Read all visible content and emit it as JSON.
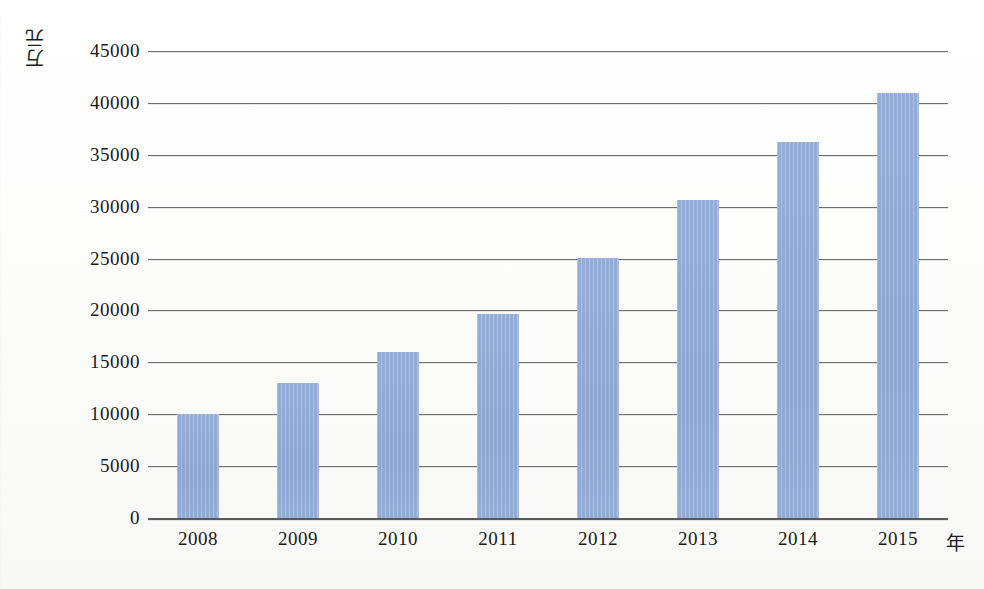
{
  "chart_data": {
    "type": "bar",
    "title": "",
    "subtitle": "",
    "xlabel": "年",
    "ylabel": "万元",
    "categories": [
      "2008",
      "2009",
      "2010",
      "2011",
      "2012",
      "2013",
      "2014",
      "2015"
    ],
    "values": [
      10000,
      13000,
      16000,
      19700,
      25100,
      30600,
      36200,
      41000
    ],
    "series": [
      {
        "name": "",
        "values": [
          10000,
          13000,
          16000,
          19700,
          25100,
          30600,
          36200,
          41000
        ]
      }
    ],
    "ylim": [
      0,
      45000
    ],
    "ytick_labels": [
      "0",
      "5000",
      "10000",
      "15000",
      "20000",
      "25000",
      "30000",
      "35000",
      "40000",
      "45000"
    ],
    "ytick_values": [
      0,
      5000,
      10000,
      15000,
      20000,
      25000,
      30000,
      35000,
      40000,
      45000
    ],
    "ytick_step": 5000,
    "grid": true,
    "grid_axis": "y",
    "legend": false,
    "legend_position": "none",
    "bar_color": "#8da8d4",
    "gridline_color": "#6e6e6e",
    "axis_color": "#5a5a5a",
    "background_color": "#fdfdfc",
    "text_color": "#1a1a1a",
    "annotations": []
  },
  "axes": {
    "y_unit_label": "万元",
    "x_unit_label": "年"
  }
}
